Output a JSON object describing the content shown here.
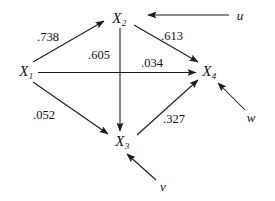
{
  "diagram": {
    "type": "path-diagram",
    "background_color": "#ffffff",
    "line_color": "#1a1a1a",
    "nodes": [
      {
        "id": "X1",
        "base": "X",
        "sub": "1",
        "x": 26,
        "y": 71
      },
      {
        "id": "X2",
        "base": "X",
        "sub": "2",
        "x": 119,
        "y": 18
      },
      {
        "id": "X3",
        "base": "X",
        "sub": "3",
        "x": 122,
        "y": 141
      },
      {
        "id": "X4",
        "base": "X",
        "sub": "4",
        "x": 209,
        "y": 71
      }
    ],
    "disturbances": [
      {
        "id": "u",
        "label": "u",
        "x": 240,
        "y": 15
      },
      {
        "id": "v",
        "label": "v",
        "x": 163,
        "y": 186
      },
      {
        "id": "w",
        "label": "w",
        "x": 251,
        "y": 117
      }
    ],
    "paths": [
      {
        "id": "x1-x2",
        "from": "X1",
        "to": "X2",
        "coefficient": ".738",
        "label_x": 48,
        "label_y": 37
      },
      {
        "id": "x2-x3",
        "from": "X2",
        "to": "X3",
        "coefficient": ".605",
        "label_x": 99,
        "label_y": 55
      },
      {
        "id": "x2-x4",
        "from": "X2",
        "to": "X4",
        "coefficient": ".613",
        "label_x": 172,
        "label_y": 36
      },
      {
        "id": "x1-x4",
        "from": "X1",
        "to": "X4",
        "coefficient": ".034",
        "label_x": 152,
        "label_y": 63
      },
      {
        "id": "x1-x3",
        "from": "X1",
        "to": "X3",
        "coefficient": ".052",
        "label_x": 44,
        "label_y": 115
      },
      {
        "id": "x3-x4",
        "from": "X3",
        "to": "X4",
        "coefficient": ".327",
        "label_x": 174,
        "label_y": 119
      },
      {
        "id": "u-x2",
        "from": "u",
        "to": "X2",
        "coefficient": "",
        "label_x": 0,
        "label_y": 0
      },
      {
        "id": "v-x3",
        "from": "v",
        "to": "X3",
        "coefficient": "",
        "label_x": 0,
        "label_y": 0
      },
      {
        "id": "w-x4",
        "from": "w",
        "to": "X4",
        "coefficient": "",
        "label_x": 0,
        "label_y": 0
      }
    ]
  }
}
